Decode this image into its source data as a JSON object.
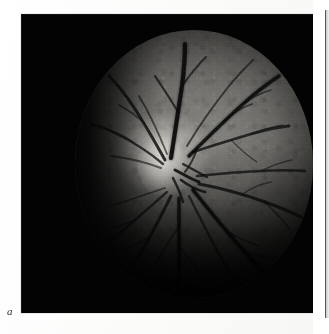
{
  "document": {
    "kind": "printed-figure-plate",
    "background_color": "#fdfdfd",
    "page_width": 329,
    "page_height": 334
  },
  "figure": {
    "label": "a",
    "label_style": "italic-serif",
    "caption": "",
    "modality": "retinal fundus photograph",
    "color_mode": "grayscale",
    "frame": {
      "x": 21,
      "y": 14,
      "width": 292,
      "height": 299,
      "background_color": "#030303"
    },
    "fundus": {
      "shape": "circular",
      "center_x": 173,
      "center_y": 164,
      "radius_x": 119,
      "radius_y": 134,
      "border_color": "#000000",
      "bright_region": "optic disc",
      "bright_region_color": "#f4f2ec",
      "mid_tone_color": "#6e6d69",
      "dark_tone_color": "#232320",
      "vessel_color": "#121212"
    },
    "features": [
      {
        "name": "optic-disc",
        "x": 144,
        "y": 149,
        "description": "bright optic nerve head, nasal / left of centre"
      },
      {
        "name": "vascular-arcades",
        "description": "retinal vessels radiating from the optic disc in all directions"
      },
      {
        "name": "superior-arcade",
        "description": "vessels sweeping up and to the left and right"
      },
      {
        "name": "inferior-arcade",
        "description": "vessels sweeping down and fanning temporally"
      },
      {
        "name": "peripheral-fall-off",
        "description": "illumination falls off toward the nasal and inferior periphery"
      }
    ]
  },
  "adjacent_panel": {
    "present": true,
    "position": "right-edge-cropped",
    "x": 325,
    "width": 4,
    "edge_color": "#5a5a5a"
  },
  "colors": {
    "paper": "#fdfdfd",
    "panel_black": "#030303",
    "ink": "#2c2c2c"
  }
}
